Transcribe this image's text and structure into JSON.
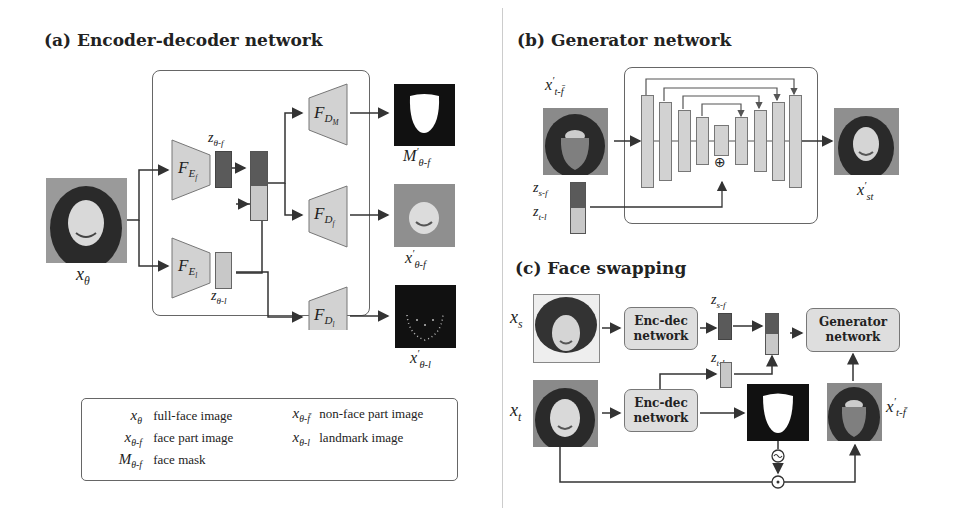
{
  "panel_a": {
    "title": "(a) Encoder-decoder network",
    "input_label": "x_θ",
    "encoders": [
      {
        "name": "F_E_f",
        "base": "F",
        "sub": "E",
        "subsub": "f"
      },
      {
        "name": "F_E_l",
        "base": "F",
        "sub": "E",
        "subsub": "l"
      }
    ],
    "decoders": [
      {
        "name": "F_D_M",
        "base": "F",
        "sub": "D",
        "subsub": "M"
      },
      {
        "name": "F_D_f",
        "base": "F",
        "sub": "D",
        "subsub": "f"
      },
      {
        "name": "F_D_l",
        "base": "F",
        "sub": "D",
        "subsub": "l"
      }
    ],
    "latents": {
      "z_face": {
        "base": "z",
        "sub": "θ-f"
      },
      "z_landmark": {
        "base": "z",
        "sub": "θ-l"
      }
    },
    "outputs": [
      {
        "name": "face-mask-output",
        "base": "M",
        "sup": "′",
        "sub": "θ-f"
      },
      {
        "name": "face-part-output",
        "base": "x",
        "sup": "′",
        "sub": "θ-f"
      },
      {
        "name": "landmark-output",
        "base": "x",
        "sup": "′",
        "sub": "θ-l"
      }
    ]
  },
  "legend": {
    "items": [
      {
        "sym_base": "x",
        "sym_sub": "θ",
        "desc": "full-face image"
      },
      {
        "sym_base": "x",
        "sym_sub": "θ-f̄",
        "desc": "non-face part image"
      },
      {
        "sym_base": "x",
        "sym_sub": "θ-f",
        "desc": "face part image"
      },
      {
        "sym_base": "x",
        "sym_sub": "θ-l",
        "desc": "landmark image"
      },
      {
        "sym_base": "M",
        "sym_sub": "θ-f",
        "desc": "face mask"
      }
    ]
  },
  "panel_b": {
    "title": "(b) Generator network",
    "input_label": {
      "base": "x",
      "sup": "′",
      "sub": "t-f̄"
    },
    "latent_labels": [
      {
        "base": "z",
        "sub": "s-f"
      },
      {
        "base": "z",
        "sub": "t-l"
      }
    ],
    "add_symbol": "⊕",
    "output_label": {
      "base": "x",
      "sup": "′",
      "sub": "st"
    }
  },
  "panel_c": {
    "title": "(c) Face swapping",
    "source_label": {
      "base": "x",
      "sub": "s"
    },
    "target_label": {
      "base": "x",
      "sub": "t"
    },
    "encdec_label_line1": "Enc-dec",
    "encdec_label_line2": "network",
    "generator_label_line1": "Generator",
    "generator_label_line2": "network",
    "latent_labels": [
      {
        "base": "z",
        "sub": "s-f"
      },
      {
        "base": "z",
        "sub": "t-l"
      }
    ],
    "negate_symbol": "~",
    "multiply_symbol": "⊙",
    "nonface_label": {
      "base": "x",
      "sup": "′",
      "sub": "t-f̄"
    }
  },
  "colors": {
    "frame": "#666666",
    "dark_latent": "#5a5a5a",
    "light_latent": "#c8c8c8",
    "module_fill": "#d2d2d2",
    "arrow": "#333333"
  }
}
